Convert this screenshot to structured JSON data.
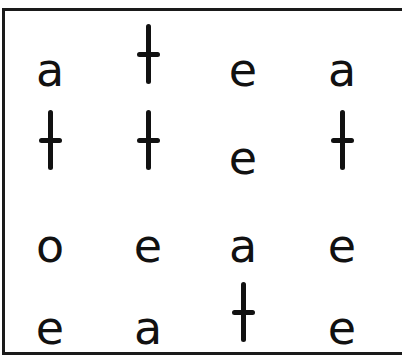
{
  "grid": {
    "rows": [
      {
        "cells": [
          {
            "letter": "a",
            "x": 50,
            "baseline": 84
          },
          {
            "letter": "t",
            "x": 148,
            "baseline": 84
          },
          {
            "letter": "e",
            "x": 243,
            "baseline": 84
          },
          {
            "letter": "a",
            "x": 342,
            "baseline": 84
          }
        ]
      },
      {
        "cells": [
          {
            "letter": "t",
            "x": 50,
            "baseline": 170
          },
          {
            "letter": "t",
            "x": 148,
            "baseline": 170
          },
          {
            "letter": "e",
            "x": 243,
            "baseline": 172
          },
          {
            "letter": "t",
            "x": 342,
            "baseline": 170
          }
        ]
      },
      {
        "cells": [
          {
            "letter": "o",
            "x": 50,
            "baseline": 260
          },
          {
            "letter": "e",
            "x": 148,
            "baseline": 260
          },
          {
            "letter": "a",
            "x": 243,
            "baseline": 260
          },
          {
            "letter": "e",
            "x": 342,
            "baseline": 260
          }
        ]
      },
      {
        "cells": [
          {
            "letter": "e",
            "x": 50,
            "baseline": 342
          },
          {
            "letter": "a",
            "x": 148,
            "baseline": 342
          },
          {
            "letter": "t",
            "x": 243,
            "baseline": 342
          },
          {
            "letter": "e",
            "x": 342,
            "baseline": 342
          }
        ]
      }
    ]
  },
  "colors": {
    "ink": "#111111",
    "border": "#1a1a1a",
    "background": "#ffffff"
  }
}
